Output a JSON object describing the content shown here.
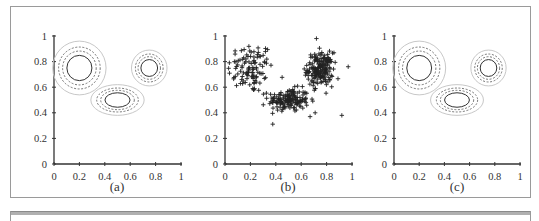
{
  "figure": {
    "panels": [
      {
        "id": "a",
        "caption": "(a)"
      },
      {
        "id": "b",
        "caption": "(b)"
      },
      {
        "id": "c",
        "caption": "(c)"
      }
    ],
    "axis_color": "#333333",
    "contour_inner_color": "#333333",
    "contour_dashed_color": "#555555",
    "contour_outer_color": "#c8c8c8",
    "marker_color": "#222222"
  },
  "chart_data": [
    {
      "type": "contour",
      "title": "(a)",
      "xlabel": "",
      "ylabel": "",
      "xlim": [
        0,
        1
      ],
      "ylim": [
        0,
        1
      ],
      "xticks": [
        "0",
        "0.2",
        "0.4",
        "0.6",
        "0.8",
        "1"
      ],
      "yticks": [
        "0",
        "0.2",
        "0.4",
        "0.6",
        "0.8",
        "1"
      ],
      "grid": false,
      "components": [
        {
          "center": [
            0.2,
            0.75
          ],
          "spread_x": 0.21,
          "spread_y": 0.21
        },
        {
          "center": [
            0.5,
            0.5
          ],
          "spread_x": 0.21,
          "spread_y": 0.12
        },
        {
          "center": [
            0.75,
            0.75
          ],
          "spread_x": 0.14,
          "spread_y": 0.14
        }
      ],
      "contour_levels": [
        "inner solid",
        "dashed",
        "dashed",
        "outer light"
      ]
    },
    {
      "type": "scatter",
      "title": "(b)",
      "marker": "+",
      "xlabel": "",
      "ylabel": "",
      "xlim": [
        0,
        1
      ],
      "ylim": [
        0,
        1
      ],
      "xticks": [
        "0",
        "0.2",
        "0.4",
        "0.6",
        "0.8",
        "1"
      ],
      "yticks": [
        "0",
        "0.2",
        "0.4",
        "0.6",
        "0.8",
        "1"
      ],
      "grid": false,
      "clusters": [
        {
          "center": [
            0.2,
            0.75
          ],
          "std": [
            0.09,
            0.1
          ],
          "n_points": 110,
          "density": "diffuse"
        },
        {
          "center": [
            0.5,
            0.5
          ],
          "std": [
            0.08,
            0.045
          ],
          "n_points": 160,
          "density": "dense"
        },
        {
          "center": [
            0.75,
            0.74
          ],
          "std": [
            0.05,
            0.065
          ],
          "n_points": 190,
          "density": "dense"
        }
      ],
      "outliers": [
        [
          0.92,
          0.38
        ],
        [
          0.97,
          0.76
        ],
        [
          0.72,
          0.98
        ],
        [
          0.67,
          0.37
        ],
        [
          0.71,
          0.4
        ]
      ],
      "provenance": {
        "cluster_centers": "read from screenshot",
        "std": "estimated from visual spread",
        "n_points": "estimated from visual density",
        "outliers": "read from screenshot",
        "rendered_points": "synthetic: generated from a seeded RNG using the estimated parameters, not transcribed from the screenshot"
      }
    },
    {
      "type": "contour",
      "title": "(c)",
      "xlabel": "",
      "ylabel": "",
      "xlim": [
        0,
        1
      ],
      "ylim": [
        0,
        1
      ],
      "xticks": [
        "0",
        "0.2",
        "0.4",
        "0.6",
        "0.8",
        "1"
      ],
      "yticks": [
        "0",
        "0.2",
        "0.4",
        "0.6",
        "0.8",
        "1"
      ],
      "grid": false,
      "components": [
        {
          "center": [
            0.2,
            0.75
          ],
          "spread_x": 0.21,
          "spread_y": 0.21
        },
        {
          "center": [
            0.5,
            0.5
          ],
          "spread_x": 0.21,
          "spread_y": 0.12
        },
        {
          "center": [
            0.75,
            0.75
          ],
          "spread_x": 0.14,
          "spread_y": 0.14
        }
      ],
      "contour_levels": [
        "inner solid",
        "dashed",
        "dashed",
        "outer light"
      ]
    }
  ]
}
